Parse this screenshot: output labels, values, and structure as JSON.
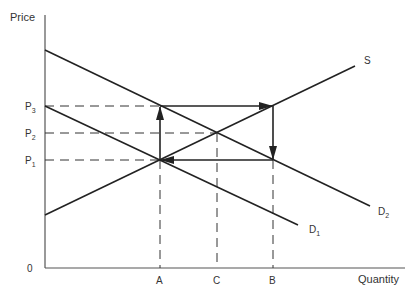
{
  "diagram": {
    "type": "supply-demand",
    "y_axis_label": "Price",
    "x_axis_label": "Quantity",
    "origin_label": "0",
    "price_levels": [
      {
        "label": "P",
        "sub": "3",
        "y": 106
      },
      {
        "label": "P",
        "sub": "2",
        "y": 133
      },
      {
        "label": "P",
        "sub": "1",
        "y": 160
      }
    ],
    "quantity_levels": [
      {
        "label": "A",
        "x": 160
      },
      {
        "label": "C",
        "x": 217
      },
      {
        "label": "B",
        "x": 273
      }
    ],
    "curves": [
      {
        "name": "S",
        "label": "S",
        "sub": ""
      },
      {
        "name": "D2",
        "label": "D",
        "sub": "2"
      },
      {
        "name": "D1",
        "label": "D",
        "sub": "1"
      }
    ],
    "arrows": [
      {
        "from": "A,P1",
        "to": "A,P3",
        "direction": "up"
      },
      {
        "from": "A,P3",
        "to": "B,P3",
        "direction": "right"
      },
      {
        "from": "B,P3",
        "to": "B,P1",
        "direction": "down"
      },
      {
        "from": "B,P1",
        "to": "A,P1",
        "direction": "left"
      }
    ],
    "colors": {
      "line": "#222222",
      "text": "#333333",
      "axis": "#555555"
    }
  }
}
